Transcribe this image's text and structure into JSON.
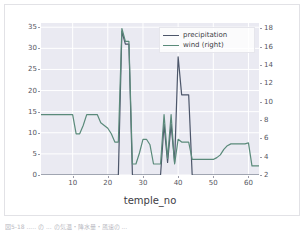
{
  "figure": {
    "caption": "図5-18  ..... の ... の気温・降水量・風速の ..."
  },
  "legend": {
    "position": "upper right",
    "entries": [
      {
        "label": "precipitation",
        "color": "#4c566a"
      },
      {
        "label": "wind (right)",
        "color": "#5a8a7a"
      }
    ]
  },
  "chart_data": {
    "type": "line",
    "title": "",
    "xlabel": "temple_no",
    "ylabel": "",
    "ylabel_right": "",
    "grid": true,
    "background": "#eaeaf2",
    "gridline_color": "#ffffff",
    "xlim": [
      1,
      63
    ],
    "ylim": [
      0,
      36
    ],
    "ylim_right": [
      2,
      18.6
    ],
    "xticks": [
      10,
      20,
      30,
      40,
      50,
      60
    ],
    "yticks_left": [
      0,
      5,
      10,
      15,
      20,
      25,
      30,
      35
    ],
    "yticks_right": [
      2,
      4,
      6,
      8,
      10,
      12,
      14,
      16,
      18
    ],
    "x": [
      1,
      2,
      3,
      4,
      5,
      6,
      7,
      8,
      9,
      10,
      11,
      12,
      13,
      14,
      15,
      16,
      17,
      18,
      19,
      20,
      21,
      22,
      23,
      24,
      25,
      26,
      27,
      28,
      29,
      30,
      31,
      32,
      33,
      34,
      35,
      36,
      37,
      38,
      39,
      40,
      41,
      42,
      43,
      44,
      45,
      46,
      47,
      48,
      49,
      50,
      51,
      52,
      53,
      54,
      55,
      56,
      57,
      58,
      59,
      60,
      61,
      62,
      63
    ],
    "series": [
      {
        "name": "precipitation",
        "axis": "left",
        "color": "#4c566a",
        "values": [
          0,
          0,
          0,
          0,
          0,
          0,
          0,
          0,
          0,
          0,
          0,
          0,
          0,
          0,
          0,
          0,
          0,
          0,
          0,
          0,
          0,
          0,
          0,
          34,
          31,
          31,
          0,
          0,
          0,
          0,
          0,
          0,
          0,
          0,
          0,
          12,
          3,
          12,
          3,
          28,
          19,
          19,
          19,
          0,
          0,
          0,
          0,
          0,
          0,
          0,
          0,
          0,
          0,
          0,
          0,
          0,
          0,
          0,
          0,
          0,
          0,
          0,
          0
        ]
      },
      {
        "name": "wind (right)",
        "axis": "right",
        "color": "#5a8a7a",
        "values": [
          8.6,
          8.6,
          8.6,
          8.6,
          8.6,
          8.6,
          8.6,
          8.6,
          8.6,
          8.6,
          6.5,
          6.5,
          7.4,
          8.6,
          8.6,
          8.6,
          8.6,
          7.7,
          7.4,
          7.1,
          6.5,
          5.6,
          5.6,
          18.0,
          16.6,
          16.6,
          3.2,
          3.2,
          4.4,
          5.9,
          5.9,
          5.3,
          3.2,
          3.2,
          3.2,
          8.6,
          3.8,
          8.6,
          3.2,
          5.9,
          5.6,
          5.6,
          5.6,
          3.7,
          3.7,
          3.7,
          3.7,
          3.7,
          3.7,
          3.7,
          3.9,
          4.2,
          4.8,
          5.2,
          5.4,
          5.4,
          5.4,
          5.4,
          5.4,
          5.5,
          3.0,
          3.0,
          3.0
        ]
      }
    ]
  }
}
